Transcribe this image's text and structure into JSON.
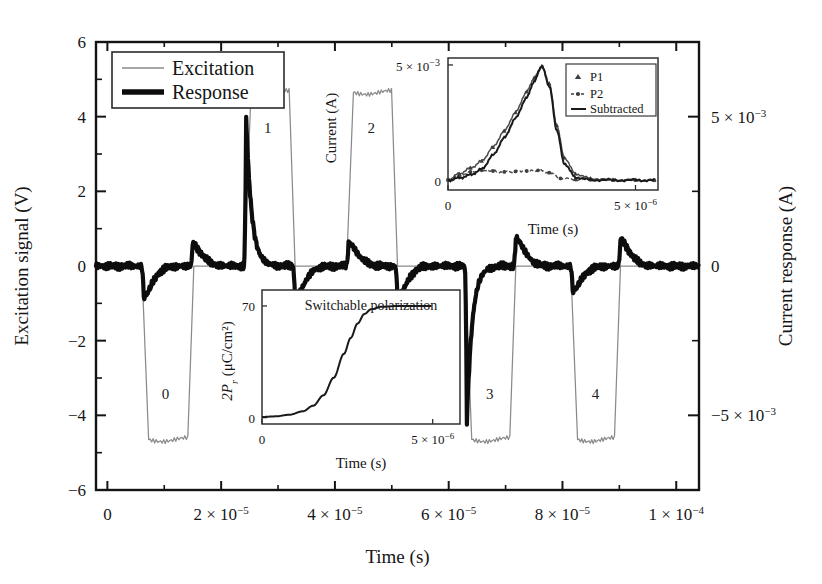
{
  "figure": {
    "background": "#ffffff",
    "ink": "#141414",
    "excitation_color": "#8a8a8a",
    "response_color": "#0d0d0d"
  },
  "main_axes": {
    "xlabel": "Time (s)",
    "left_ylabel": "Excitation signal (V)",
    "right_ylabel": "Current response (A)",
    "x_ticks": [
      "0",
      "2 × 10⁻⁵",
      "4 × 10⁻⁵",
      "6 × 10⁻⁵",
      "8 × 10⁻⁵",
      "1 × 10⁻⁴"
    ],
    "left_y_ticks": [
      "6",
      "4",
      "2",
      "0",
      "−2",
      "−4",
      "−6"
    ],
    "right_y_ticks": [
      "5 × 10⁻³",
      "0",
      "−5 × 10⁻³"
    ],
    "inset_scale_note": "5 × 10⁻³"
  },
  "legend": {
    "excitation_label": "Excitation",
    "response_label": "Response"
  },
  "pulse_labels": [
    "0",
    "1",
    "2",
    "3",
    "4"
  ],
  "inset_current": {
    "xlabel": "Time (s)",
    "ylabel": "Current (A)",
    "x_ticks": [
      "0",
      "5 × 10⁻⁶"
    ],
    "y_ticks": [
      "0"
    ],
    "y_top_note": "5 × 10⁻³",
    "legend": [
      "P1",
      "P2",
      "Subtracted"
    ]
  },
  "inset_polarization": {
    "caption": "Switchable polarization",
    "xlabel": "Time (s)",
    "ylabel_main": "2P",
    "ylabel_sub": "r",
    "ylabel_unit": " (μC/cm²)",
    "x_ticks": [
      "0",
      "5 × 10⁻⁶"
    ],
    "y_ticks": [
      "70",
      "0"
    ]
  },
  "chart_data": {
    "type": "line",
    "title": "",
    "xlabel": "Time (s)",
    "ylabel": "Excitation signal (V)",
    "y2label": "Current response (A)",
    "xlim": [
      -2e-06,
      0.000104
    ],
    "ylim": [
      -6,
      6
    ],
    "y2lim": [
      -0.0075,
      0.0075
    ],
    "grid": false,
    "legend_position": "top-left",
    "series": [
      {
        "name": "Excitation",
        "units": "V",
        "description": "PUND pulse train: pulse 0 negative, pulses 1 and 2 positive, pulses 3 and 4 negative; plateau magnitude 4.65 V, trapezoidal with ~1e-6 s rise/fall",
        "pulses": [
          {
            "label": "0",
            "polarity": -1,
            "amplitude": -4.65,
            "t_start": 6.2e-06,
            "t_end": 1.52e-05
          },
          {
            "label": "1",
            "polarity": 1,
            "amplitude": 4.65,
            "t_start": 2.42e-05,
            "t_end": 3.3e-05
          },
          {
            "label": "2",
            "polarity": 1,
            "amplitude": 4.65,
            "t_start": 4.22e-05,
            "t_end": 5.1e-05
          },
          {
            "label": "3",
            "polarity": -1,
            "amplitude": -4.65,
            "t_start": 6.3e-05,
            "t_end": 7.18e-05
          },
          {
            "label": "4",
            "polarity": -1,
            "amplitude": -4.65,
            "t_start": 8.16e-05,
            "t_end": 9.02e-05
          }
        ],
        "baseline": 0
      },
      {
        "name": "Response",
        "units": "A",
        "description": "Current response: large switching spike at pulse 1 (+5.0e-3 A) and pulse 3 (-5.2e-3 A); small non-switching transients elsewhere",
        "events": [
          {
            "t": 6.4e-06,
            "peak": -0.00105,
            "kind": "small-negative-transient"
          },
          {
            "t": 1.5e-05,
            "peak": 0.00075,
            "kind": "small-positive-transient"
          },
          {
            "t": 2.44e-05,
            "peak": 0.005,
            "kind": "large-switching-spike"
          },
          {
            "t": 3.3e-05,
            "peak": -0.00115,
            "kind": "small-negative-transient"
          },
          {
            "t": 4.24e-05,
            "peak": 0.0008,
            "kind": "small-positive-transient"
          },
          {
            "t": 5.1e-05,
            "peak": -0.0011,
            "kind": "small-negative-transient"
          },
          {
            "t": 6.32e-05,
            "peak": -0.0052,
            "kind": "large-switching-spike"
          },
          {
            "t": 7.18e-05,
            "peak": 0.00095,
            "kind": "small-positive-transient"
          },
          {
            "t": 8.18e-05,
            "peak": -0.00085,
            "kind": "small-negative-transient"
          },
          {
            "t": 9.02e-05,
            "peak": 0.0009,
            "kind": "small-positive-transient"
          }
        ],
        "baseline": 0
      }
    ],
    "insets": [
      {
        "id": "inset-current",
        "type": "line",
        "title": "",
        "xlabel": "Time (s)",
        "ylabel": "Current (A)",
        "xlim": [
          0,
          5.6e-06
        ],
        "ylim": [
          -0.0004,
          0.0053
        ],
        "x_ticks": [
          0,
          5e-06
        ],
        "y_ticks": [
          0
        ],
        "y_top_note": "5 × 10⁻³",
        "series": [
          {
            "name": "P1",
            "marker": "triangle",
            "style": "markers",
            "x": [
              0,
              3e-07,
              6e-07,
              9e-07,
              1.2e-06,
              1.5e-06,
              1.8e-06,
              2.1e-06,
              2.3e-06,
              2.5e-06,
              2.7e-06,
              2.9e-06,
              3.1e-06,
              3.4e-06,
              3.8e-06,
              4.4e-06,
              5e-06,
              5.5e-06
            ],
            "y": [
              5e-05,
              0.0003,
              0.00055,
              0.00085,
              0.00145,
              0.00215,
              0.00295,
              0.00385,
              0.00445,
              0.00495,
              0.0042,
              0.0024,
              0.001,
              0.0003,
              0.0001,
              5e-05,
              4e-05,
              3e-05
            ]
          },
          {
            "name": "P2",
            "marker": "circle",
            "style": "dashed-markers",
            "x": [
              0,
              3e-07,
              6e-07,
              9e-07,
              1.2e-06,
              1.5e-06,
              1.8e-06,
              2.1e-06,
              2.4e-06,
              2.7e-06,
              3e-06,
              3.4e-06,
              3.8e-06,
              4.4e-06,
              5e-06,
              5.5e-06
            ],
            "y": [
              5e-05,
              0.00022,
              0.00038,
              0.00045,
              0.00042,
              0.00038,
              0.0004,
              0.00042,
              0.00045,
              0.00035,
              0.0001,
              5e-05,
              4e-05,
              3e-05,
              3e-05,
              2e-05
            ]
          },
          {
            "name": "Subtracted",
            "marker": "none",
            "style": "solid",
            "x": [
              0,
              3e-07,
              6e-07,
              9e-07,
              1.2e-06,
              1.5e-06,
              1.8e-06,
              2.1e-06,
              2.3e-06,
              2.5e-06,
              2.7e-06,
              2.9e-06,
              3.1e-06,
              3.4e-06,
              3.8e-06,
              4.4e-06,
              5e-06,
              5.5e-06
            ],
            "y": [
              2e-05,
              0.00012,
              0.00025,
              0.0005,
              0.0011,
              0.00185,
              0.0027,
              0.0036,
              0.0043,
              0.00495,
              0.0041,
              0.0022,
              0.00075,
              0.00015,
              4e-05,
              2e-05,
              2e-05,
              1e-05
            ]
          }
        ]
      },
      {
        "id": "inset-polarization",
        "type": "line",
        "title": "Switchable polarization",
        "xlabel": "Time (s)",
        "ylabel": "2Pr (μC/cm²)",
        "xlim": [
          0,
          5.8e-06
        ],
        "ylim": [
          -4,
          80
        ],
        "x_ticks": [
          0,
          5e-06
        ],
        "y_ticks": [
          0,
          70
        ],
        "series": [
          {
            "name": "2Pr",
            "style": "solid",
            "x": [
              0,
              4e-07,
              8e-07,
              1.2e-06,
              1.5e-06,
              1.8e-06,
              2.1e-06,
              2.4e-06,
              2.6e-06,
              2.8e-06,
              3e-06,
              3.2e-06,
              3.5e-06,
              4e-06,
              4.5e-06,
              5e-06,
              5.6e-06
            ],
            "y": [
              0.4,
              0.8,
              1.8,
              4.0,
              7.5,
              14.0,
              25.0,
              40.0,
              50.0,
              59.0,
              65.0,
              68.0,
              69.5,
              70.0,
              70.0,
              70.0
            ]
          }
        ]
      }
    ]
  }
}
